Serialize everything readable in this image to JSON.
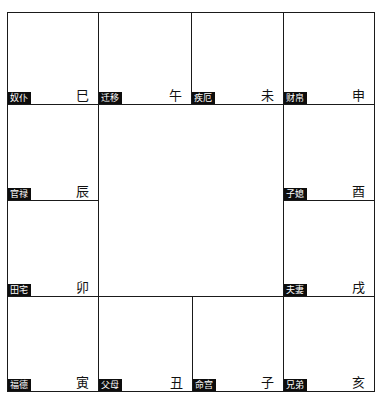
{
  "chart": {
    "type": "ziwei-doushu-palace-grid",
    "center": {
      "content": ""
    },
    "palaces": [
      {
        "id": "si",
        "palace": "奴仆",
        "branch": "巳",
        "row": 0,
        "col": 0
      },
      {
        "id": "wu",
        "palace": "迁移",
        "branch": "午",
        "row": 0,
        "col": 1
      },
      {
        "id": "wei",
        "palace": "疾厄",
        "branch": "未",
        "row": 0,
        "col": 2
      },
      {
        "id": "shen",
        "palace": "财帛",
        "branch": "申",
        "row": 0,
        "col": 3
      },
      {
        "id": "chen",
        "palace": "官禄",
        "branch": "辰",
        "row": 1,
        "col": 0
      },
      {
        "id": "you",
        "palace": "子媳",
        "branch": "酉",
        "row": 1,
        "col": 3
      },
      {
        "id": "mao",
        "palace": "田宅",
        "branch": "卯",
        "row": 2,
        "col": 0
      },
      {
        "id": "xu",
        "palace": "夫妻",
        "branch": "戌",
        "row": 2,
        "col": 3
      },
      {
        "id": "yin",
        "palace": "福德",
        "branch": "寅",
        "row": 3,
        "col": 0
      },
      {
        "id": "chou",
        "palace": "父母",
        "branch": "丑",
        "row": 3,
        "col": 1
      },
      {
        "id": "zi",
        "palace": "命宫",
        "branch": "子",
        "row": 3,
        "col": 2
      },
      {
        "id": "hai",
        "palace": "兄弟",
        "branch": "亥",
        "row": 3,
        "col": 3
      }
    ]
  },
  "colors": {
    "border": "#1a1a1a",
    "label_bg": "#0d0d0d",
    "label_text": "#ffffff",
    "branch_text": "#111111",
    "background": "#ffffff"
  }
}
